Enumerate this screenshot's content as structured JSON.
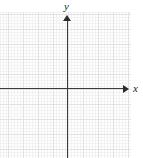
{
  "figure": {
    "type": "blank-cartesian-grid",
    "width": 143,
    "height": 158,
    "background_color": "#ffffff"
  },
  "axes": {
    "x": {
      "label": "x",
      "name": "x-axis",
      "orientation": "horizontal",
      "color": "#3b3b3b",
      "arrow_direction": "right",
      "has_tick_labels": false,
      "tick_labels": []
    },
    "y": {
      "label": "y",
      "name": "y-axis",
      "orientation": "vertical",
      "color": "#3b3b3b",
      "arrow_direction": "up",
      "has_tick_labels": false,
      "tick_labels": []
    }
  },
  "grid": {
    "visible": true,
    "minor_line_color": "#f2f2f2",
    "major_line_color": "#e2e2e2",
    "minor_spacing_px": 3,
    "major_spacing_px": 15
  },
  "chart_data": {
    "type": "scatter",
    "title": "",
    "subtitle": "",
    "xlabel": "x",
    "ylabel": "y",
    "x": [],
    "y": [],
    "series": [],
    "categories": [],
    "values": [],
    "annotations": [],
    "legend": [],
    "legend_position": "none",
    "grid": true,
    "xticklabels": [],
    "yticklabels": [],
    "note": "Empty coordinate plane: axes drawn with arrowheads and a light square grid; no data points, curves, or numeric tick labels are plotted."
  }
}
